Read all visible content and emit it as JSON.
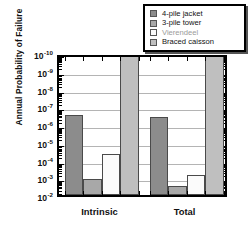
{
  "chart_data": {
    "type": "bar",
    "title": "",
    "xlabel": "",
    "ylabel": "Annual Probability of Failure",
    "categories": [
      "Intrinsic",
      "Total"
    ],
    "ylim": [
      1e-10,
      0.01
    ],
    "yscale": "log",
    "ytick_labels": [
      "10⁻²",
      "10⁻³",
      "10⁻⁴",
      "10⁻⁵",
      "10⁻⁶",
      "10⁻⁷",
      "10⁻⁸",
      "10⁻⁹",
      "10⁻¹⁰"
    ],
    "ytick_values": [
      0.01,
      0.001,
      0.0001,
      1e-05,
      1e-06,
      1e-07,
      1e-08,
      1e-09,
      1e-10
    ],
    "grid": true,
    "legend_position": "top-right",
    "series": [
      {
        "name": "4-pile jacket",
        "color": "#8c8c8c",
        "values": [
          3e-07,
          4e-07
        ]
      },
      {
        "name": "3-pile tower",
        "color": "#a8a8a8",
        "values": [
          0.0012,
          0.003
        ]
      },
      {
        "name": "Vierendeel",
        "color": "#fbfbfb",
        "values": [
          5e-05,
          0.0007
        ]
      },
      {
        "name": "Braced caisson",
        "color": "#bfbfbf",
        "values": [
          1e-10,
          1e-10
        ]
      }
    ]
  },
  "axis": {
    "y_title": "Annual Probability of Failure",
    "y_ticks": [
      {
        "mantissa": "10",
        "exponent": "-10",
        "value": 1e-10
      },
      {
        "mantissa": "10",
        "exponent": "-9",
        "value": 1e-09
      },
      {
        "mantissa": "10",
        "exponent": "-8",
        "value": 1e-08
      },
      {
        "mantissa": "10",
        "exponent": "-7",
        "value": 1e-07
      },
      {
        "mantissa": "10",
        "exponent": "-6",
        "value": 1e-06
      },
      {
        "mantissa": "10",
        "exponent": "-5",
        "value": 1e-05
      },
      {
        "mantissa": "10",
        "exponent": "-4",
        "value": 0.0001
      },
      {
        "mantissa": "10",
        "exponent": "-3",
        "value": 0.001
      },
      {
        "mantissa": "10",
        "exponent": "-2",
        "value": 0.01
      }
    ],
    "x_labels": [
      "Intrinsic",
      "Total"
    ]
  },
  "legend": {
    "items": [
      {
        "label": "4-pile jacket",
        "color": "#8c8c8c"
      },
      {
        "label": "3-pile tower",
        "color": "#a8a8a8"
      },
      {
        "label": "Vierendeel",
        "color": "#fbfbfb"
      },
      {
        "label": "Braced caisson",
        "color": "#bfbfbf"
      }
    ]
  },
  "colors": {
    "frame": "#000000",
    "grid": "#b4b4b4",
    "background": "#ffffff",
    "bar_edge": "#4a4a4a"
  }
}
